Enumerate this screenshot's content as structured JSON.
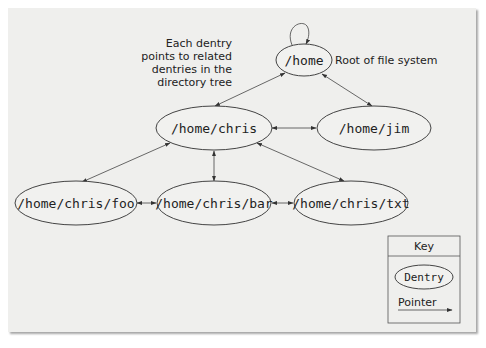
{
  "annotation": {
    "lines": [
      "Each dentry",
      "points to related",
      "dentries in the",
      "directory tree"
    ],
    "root_label": "Root of file system"
  },
  "nodes": {
    "home": "/home",
    "chris": "/home/chris",
    "jim": "/home/jim",
    "foo": "/home/chris/foo",
    "bar": "/home/chris/bar",
    "txt": "/home/chris/txt"
  },
  "edges": [
    [
      "home",
      "home"
    ],
    [
      "home",
      "chris"
    ],
    [
      "home",
      "jim"
    ],
    [
      "chris",
      "jim"
    ],
    [
      "chris",
      "foo"
    ],
    [
      "chris",
      "bar"
    ],
    [
      "chris",
      "txt"
    ],
    [
      "foo",
      "bar"
    ],
    [
      "bar",
      "txt"
    ]
  ],
  "key": {
    "title": "Key",
    "dentry_label": "Dentry",
    "pointer_label": "Pointer"
  },
  "colors": {
    "panel_bg": "#efefed",
    "stroke": "#444444",
    "text": "#222222"
  }
}
